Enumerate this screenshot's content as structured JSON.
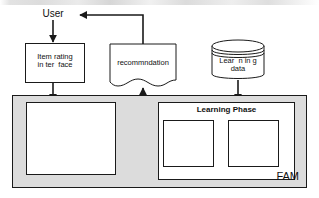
{
  "diagram": {
    "title_fragment": "",
    "actors": {
      "user": "User"
    },
    "nodes": {
      "item_rating": "Item rating\nin ter  face",
      "recommendation": "recommndation",
      "learning_data": "Lear  n in g\ndata",
      "inference_phase": "Inference phase",
      "learning_phase": "Learning Phase",
      "determine_usefulness": "dermine\nusefulness\nof   fuz z y   s",
      "determine_weight": "dermine\nconnection\nweight"
    },
    "container": {
      "label": "FAM"
    },
    "network": {
      "input_nodes": 3,
      "output_nodes": 2,
      "fully_connected": true
    },
    "colors": {
      "stroke": "#1a1a1a",
      "container_fill": "#dcdcdc",
      "box_fill": "#ffffff",
      "shadow_fill": "#a8a8a8",
      "text": "#111111"
    }
  }
}
